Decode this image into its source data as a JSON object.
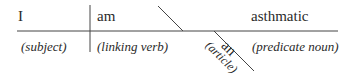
{
  "diagram": {
    "type": "sentence-diagram",
    "sentence": "I am an asthmatic",
    "words": {
      "subject": "I",
      "verb": "am",
      "predicate": "asthmatic",
      "modifier": "an"
    },
    "labels": {
      "subject": "(subject)",
      "verb": "(linking verb)",
      "predicate": "(predicate noun)",
      "modifier": "(article)"
    },
    "colors": {
      "line": "#444444",
      "text": "#2a2a2a"
    }
  }
}
